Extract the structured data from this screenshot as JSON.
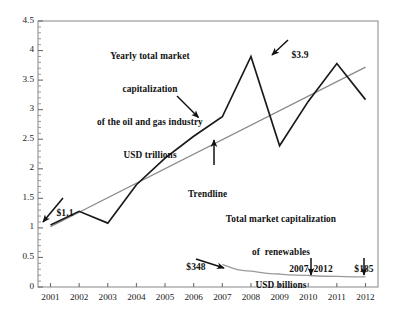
{
  "chart_data": {
    "type": "line",
    "title": "",
    "xlabel": "",
    "ylabel": "",
    "grid": false,
    "legend_position": "none",
    "ylim": [
      0,
      4.5
    ],
    "ytick_values": [
      0,
      0.5,
      1,
      1.5,
      2,
      2.5,
      3,
      3.5,
      4,
      4.5
    ],
    "ytick_labels": [
      "0",
      "0.5",
      "1",
      "1.5",
      "2",
      "2.5",
      "3",
      "3.5",
      "4",
      "4.5"
    ],
    "minor_ticks": true,
    "categories": [
      "2001",
      "2002",
      "2003",
      "2004",
      "2005",
      "2006",
      "2007",
      "2008",
      "2009",
      "2010",
      "2011",
      "2012"
    ],
    "x": [
      2001,
      2002,
      2003,
      2004,
      2005,
      2006,
      2007,
      2008,
      2009,
      2010,
      2011,
      2012
    ],
    "series": [
      {
        "name": "Yearly total market capitalization of the oil and gas industry USD trillions",
        "units": "USD trillions",
        "color": "#1a1a1a",
        "style": "solid",
        "values": [
          1.05,
          1.28,
          1.08,
          1.73,
          2.18,
          2.55,
          2.88,
          3.9,
          2.39,
          3.14,
          3.78,
          3.17
        ]
      },
      {
        "name": "Trendline",
        "units": "USD trillions",
        "color": "#8a8a8a",
        "style": "solid",
        "values": [
          1.02,
          1.27,
          1.51,
          1.76,
          2.01,
          2.26,
          2.5,
          2.75,
          3.0,
          3.24,
          3.49,
          3.72
        ]
      },
      {
        "name": "Total market capitalization of renewables USD billions",
        "units": "USD billions",
        "color": "#9a9a9a",
        "style": "solid",
        "values": [
          null,
          null,
          null,
          null,
          null,
          null,
          0.38,
          0.27,
          0.22,
          0.195,
          0.18,
          0.17
        ],
        "labelled_values": {
          "2007": "$348",
          "2012": "$185"
        }
      }
    ],
    "annotations": [
      {
        "id": "oilgas-label",
        "text": "Yearly total market\ncapitalization\nof the oil and gas industry\nUSD trillions",
        "arrow": true,
        "points_to": [
          2006.85,
          2.86
        ]
      },
      {
        "id": "trendline-label",
        "text": "Trendline",
        "arrow": true,
        "points_to": [
          2007.4,
          2.48
        ]
      },
      {
        "id": "renewables-label",
        "text": "Total market capitalization\nof  renewables\nUSD billions",
        "arrow": false,
        "points_to": null
      },
      {
        "id": "callout-1-1",
        "text": "$1.1",
        "arrow": true,
        "points_to": [
          2001,
          1.05
        ]
      },
      {
        "id": "callout-3-9",
        "text": "$3.9",
        "arrow": true,
        "points_to": [
          2008,
          3.9
        ]
      },
      {
        "id": "callout-348",
        "text": "$348",
        "arrow": true,
        "points_to": [
          2007,
          0.38
        ]
      },
      {
        "id": "callout-2007-2012",
        "text": "2007–2012",
        "arrow": true,
        "points_to": [
          2009.85,
          0.2
        ]
      },
      {
        "id": "callout-185",
        "text": "$185",
        "arrow": true,
        "points_to": [
          2011.85,
          0.175
        ]
      }
    ]
  },
  "axes": {
    "y_ticks": [
      "4.5",
      "4",
      "3.5",
      "3",
      "2.5",
      "2",
      "1.5",
      "1",
      "0.5",
      "0"
    ],
    "x_ticks": [
      "2001",
      "2002",
      "2003",
      "2004",
      "2005",
      "2006",
      "2007",
      "2008",
      "2009",
      "2010",
      "2011",
      "2012"
    ]
  },
  "annotations": {
    "oilgas": {
      "line1": "Yearly total market",
      "line2": "capitalization",
      "line3": "of the oil and gas industry",
      "line4": "USD trillions"
    },
    "trendline": {
      "label": "Trendline"
    },
    "renewables": {
      "line1": "Total market capitalization",
      "line2": "of  renewables",
      "line3": "USD billions"
    },
    "callouts": {
      "start_value": "$1.1",
      "peak_value": "$3.9",
      "renewables_start": "$348",
      "period": "2007–2012",
      "renewables_end": "$185"
    }
  },
  "colors": {
    "series_primary": "#1a1a1a",
    "series_trendline": "#8a8a8a",
    "series_renewables": "#9a9a9a",
    "frame": "#9b9b9b",
    "text": "#111111",
    "background": "#ffffff"
  }
}
